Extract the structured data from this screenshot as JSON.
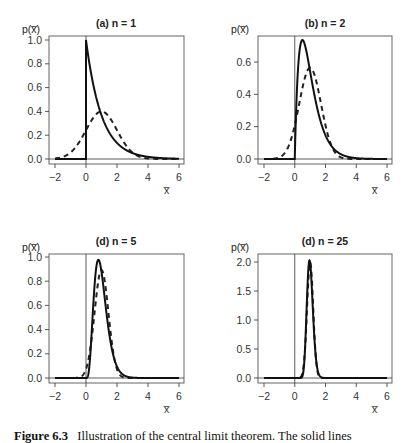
{
  "figure": {
    "caption_label": "Figure 6.3",
    "caption_text": "Illustration of the central limit theorem. The solid lines"
  },
  "chart_data": [
    {
      "type": "line",
      "title": "(a) n = 1",
      "xlabel": "x̄",
      "ylabel": "p(x̄)",
      "xlim": [
        -2.3,
        6.2
      ],
      "ylim": [
        0,
        1.0
      ],
      "xticks": [
        -2,
        0,
        2,
        4,
        6
      ],
      "yticks": [
        "0.0",
        "0.2",
        "0.4",
        "0.6",
        "0.8",
        "1.0"
      ],
      "ytick_values": [
        0,
        0.2,
        0.4,
        0.6,
        0.8,
        1.0
      ],
      "n": 1,
      "grid": false,
      "series": [
        {
          "name": "exact sampling distribution (solid)",
          "style": "solid",
          "peak_x": 0.0,
          "peak_y": 1.0
        },
        {
          "name": "normal approximation (dashed)",
          "style": "dashed",
          "peak_x": 1.0,
          "peak_y": 0.4
        }
      ]
    },
    {
      "type": "line",
      "title": "(b) n = 2",
      "xlabel": "x̄",
      "ylabel": "p(x̄)",
      "xlim": [
        -2.3,
        6.2
      ],
      "ylim": [
        0,
        0.74
      ],
      "xticks": [
        -2,
        0,
        2,
        4,
        6
      ],
      "yticks": [
        "0.0",
        "0.2",
        "0.4",
        "0.6"
      ],
      "ytick_values": [
        0,
        0.2,
        0.4,
        0.6
      ],
      "n": 2,
      "grid": false,
      "series": [
        {
          "name": "exact sampling distribution (solid)",
          "style": "solid",
          "peak_x": 0.5,
          "peak_y": 0.74
        },
        {
          "name": "normal approximation (dashed)",
          "style": "dashed",
          "peak_x": 1.0,
          "peak_y": 0.56
        }
      ]
    },
    {
      "type": "line",
      "title": "(d) n = 5",
      "xlabel": "x̄",
      "ylabel": "p(x̄)",
      "xlim": [
        -2.3,
        6.2
      ],
      "ylim": [
        0,
        1.0
      ],
      "xticks": [
        -2,
        0,
        2,
        4,
        6
      ],
      "yticks": [
        "0.0",
        "0.2",
        "0.4",
        "0.6",
        "0.8",
        "1.0"
      ],
      "ytick_values": [
        0,
        0.2,
        0.4,
        0.6,
        0.8,
        1.0
      ],
      "n": 5,
      "grid": false,
      "series": [
        {
          "name": "exact sampling distribution (solid)",
          "style": "solid",
          "peak_x": 0.8,
          "peak_y": 0.98
        },
        {
          "name": "normal approximation (dashed)",
          "style": "dashed",
          "peak_x": 1.0,
          "peak_y": 0.89
        }
      ]
    },
    {
      "type": "line",
      "title": "(d) n = 25",
      "xlabel": "x̄",
      "ylabel": "p(x̄)",
      "xlim": [
        -2.3,
        6.2
      ],
      "ylim": [
        0,
        2.0
      ],
      "xticks": [
        -2,
        0,
        2,
        4,
        6
      ],
      "yticks": [
        "0.0",
        "0.5",
        "1.0",
        "1.5",
        "2.0"
      ],
      "ytick_values": [
        0,
        0.5,
        1.0,
        1.5,
        2.0
      ],
      "n": 25,
      "grid": false,
      "series": [
        {
          "name": "exact sampling distribution (solid)",
          "style": "solid",
          "peak_x": 0.96,
          "peak_y": 2.03
        },
        {
          "name": "normal approximation (dashed)",
          "style": "dashed",
          "peak_x": 1.0,
          "peak_y": 1.99
        }
      ]
    }
  ]
}
